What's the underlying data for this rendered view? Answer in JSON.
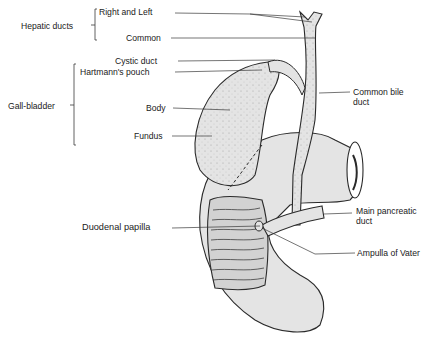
{
  "figure": {
    "colors": {
      "organ_fill": "#e4e4e4",
      "outline": "#2a2a2a",
      "leader_line": "#3a3a3a",
      "text": "#1a1a1a",
      "mucosa_fill": "#d2d2d2"
    }
  },
  "labels": {
    "hepatic_ducts": "Hepatic ducts",
    "right_and_left": "Right and Left",
    "common": "Common",
    "cystic_duct": "Cystic duct",
    "hartmanns_pouch": "Hartmann's pouch",
    "gall_bladder": "Gall-bladder",
    "body": "Body",
    "fundus": "Fundus",
    "common_bile_duct_line1": "Common bile",
    "common_bile_duct_line2": "duct",
    "duodenal_papilla": "Duodenal papilla",
    "main_pancreatic_duct_line1": "Main pancreatic",
    "main_pancreatic_duct_line2": "duct",
    "ampulla_of_vater": "Ampulla of Vater"
  },
  "groups": {
    "hepatic_ducts": [
      "Right and Left",
      "Common"
    ],
    "gall_bladder": [
      "Hartmann's pouch",
      "Body",
      "Fundus"
    ]
  }
}
